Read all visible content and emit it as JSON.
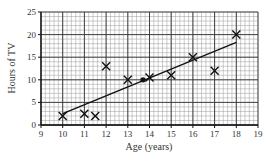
{
  "chart_data": {
    "type": "scatter",
    "title": "",
    "xlabel": "Age (years)",
    "ylabel": "Hours of TV",
    "xlim": [
      9,
      19
    ],
    "ylim": [
      0,
      25
    ],
    "xticks": [
      9,
      10,
      11,
      12,
      13,
      14,
      15,
      16,
      17,
      18,
      19
    ],
    "yticks": [
      0,
      5,
      10,
      15,
      20,
      25
    ],
    "grid": true,
    "minor_grid_x_step": 0.2,
    "minor_grid_y_step": 1,
    "series": [
      {
        "name": "Data points",
        "marker": "x",
        "points": [
          {
            "x": 10,
            "y": 2
          },
          {
            "x": 11,
            "y": 2.5
          },
          {
            "x": 11.5,
            "y": 2
          },
          {
            "x": 12,
            "y": 13
          },
          {
            "x": 13,
            "y": 10
          },
          {
            "x": 14,
            "y": 10.5
          },
          {
            "x": 15,
            "y": 11
          },
          {
            "x": 16,
            "y": 15
          },
          {
            "x": 17,
            "y": 12
          },
          {
            "x": 18,
            "y": 20
          }
        ]
      },
      {
        "name": "Mean point",
        "marker": "dot",
        "points": [
          {
            "x": 13.7,
            "y": 10
          }
        ]
      },
      {
        "name": "Line of best fit",
        "type": "line",
        "points": [
          {
            "x": 10,
            "y": 2.5
          },
          {
            "x": 18,
            "y": 18.3
          }
        ]
      }
    ]
  }
}
